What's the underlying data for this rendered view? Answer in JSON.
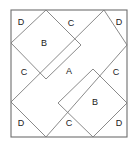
{
  "figure": {
    "background_color": "#ffffff",
    "outline_color": "#6e6e6e",
    "cut_line_color": "#7d7d7d",
    "label_color": "#1a1a1a",
    "outer_square": {
      "x": 11,
      "y": 10,
      "width": 116,
      "height": 127
    },
    "regions": [
      {
        "id": "piece-a-center",
        "label": "A",
        "shape": "rectangle",
        "cx": 69,
        "cy": 72
      },
      {
        "id": "piece-b-upper-left",
        "label": "B",
        "shape": "square-diamond",
        "cx": 44,
        "cy": 44
      },
      {
        "id": "piece-b-lower-right",
        "label": "B",
        "shape": "square-diamond",
        "cx": 95,
        "cy": 103
      },
      {
        "id": "piece-c-top",
        "label": "C",
        "shape": "triangle",
        "cx": 71,
        "cy": 24
      },
      {
        "id": "piece-c-left",
        "label": "C",
        "shape": "triangle",
        "cx": 24,
        "cy": 73
      },
      {
        "id": "piece-c-right",
        "label": "C",
        "shape": "triangle",
        "cx": 116,
        "cy": 73
      },
      {
        "id": "piece-c-bottom",
        "label": "C",
        "shape": "triangle",
        "cx": 69,
        "cy": 124
      },
      {
        "id": "piece-d-top-left",
        "label": "D",
        "shape": "corner-triangle",
        "cx": 21,
        "cy": 23
      },
      {
        "id": "piece-d-top-right",
        "label": "D",
        "shape": "corner-triangle",
        "cx": 119,
        "cy": 23
      },
      {
        "id": "piece-d-bottom-left",
        "label": "D",
        "shape": "corner-triangle",
        "cx": 21,
        "cy": 124
      },
      {
        "id": "piece-d-bottom-right",
        "label": "D",
        "shape": "corner-triangle",
        "cx": 119,
        "cy": 124
      }
    ],
    "cut_paths": [
      {
        "id": "cut-upper-left-diamond-nw",
        "d": "M 11 43 L 46 10"
      },
      {
        "id": "cut-upper-left-diamond-ne",
        "d": "M 46 10 L 81 45"
      },
      {
        "id": "cut-upper-left-diamond-se",
        "d": "M 81 45 L 46 79"
      },
      {
        "id": "cut-upper-left-diamond-sw",
        "d": "M 46 79 L 11 43"
      },
      {
        "id": "cut-lower-right-diamond-nw",
        "d": "M 58 103 L 93 69"
      },
      {
        "id": "cut-lower-right-diamond-ne",
        "d": "M 93 69 L 127 103"
      },
      {
        "id": "cut-lower-right-diamond-se",
        "d": "M 127 103 L 93 137"
      },
      {
        "id": "cut-lower-right-diamond-sw",
        "d": "M 93 137 L 58 103"
      },
      {
        "id": "cut-center-rect-upper-left",
        "d": "M 11 102 L 104 10"
      },
      {
        "id": "cut-center-rect-lower-right",
        "d": "M 46 137 L 127 45"
      },
      {
        "id": "cut-top-right-corner",
        "d": "M 104 10 L 127 45"
      },
      {
        "id": "cut-bottom-left-corner",
        "d": "M 11 102 L 46 137"
      }
    ]
  }
}
